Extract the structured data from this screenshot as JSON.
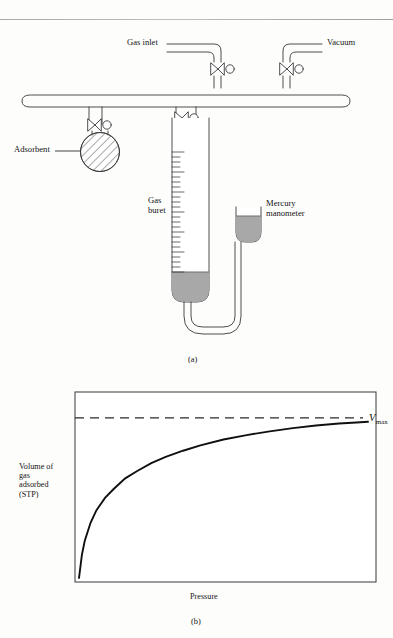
{
  "figure": {
    "panel_a": {
      "caption": "(a)",
      "labels": {
        "gas_inlet": "Gas inlet",
        "vacuum": "Vacuum",
        "adsorbent": "Adsorbent",
        "gas_buret_line1": "Gas",
        "gas_buret_line2": "buret",
        "mercury_line1": "Mercury",
        "mercury_line2": "manometer"
      },
      "colors": {
        "glass_outline": "#3a3a3a",
        "mercury_fill": "#a8a8a8",
        "hatch": "#444444",
        "background": "#fdfdfc"
      },
      "components": [
        "manifold",
        "gas-inlet-tube",
        "vacuum-tube",
        "stopcock-gas-inlet",
        "stopcock-vacuum",
        "stopcock-adsorbent",
        "stopcock-buret",
        "adsorbent-flask",
        "gas-buret",
        "mercury-manometer",
        "u-tube"
      ]
    },
    "panel_b": {
      "caption": "(b)",
      "labels": {
        "ylabel_line1": "Volume of",
        "ylabel_line2": "gas",
        "ylabel_line3": "adsorbed",
        "ylabel_line4": "(STP)",
        "xlabel": "Pressure",
        "vmax_symbol": "V",
        "vmax_subscript": "max"
      },
      "colors": {
        "frame": "#4a4a4a",
        "curve": "#101010",
        "asymptote": "#2a2a2a"
      }
    }
  },
  "chart_data": {
    "type": "line",
    "title": "",
    "xlabel": "Pressure",
    "ylabel": "Volume of gas adsorbed (STP)",
    "grid": false,
    "legend": null,
    "xlim": [
      0,
      1
    ],
    "ylim": [
      0,
      1
    ],
    "axis_ticks": "none",
    "annotations": [
      {
        "name": "vmax-asymptote",
        "text": "Vmax",
        "style": "dashed-horizontal-line",
        "y": 0.9
      }
    ],
    "series": [
      {
        "name": "Langmuir adsorption isotherm",
        "description": "Volume of gas adsorbed rises steeply then saturates at Vmax",
        "x": [
          0.0,
          0.01,
          0.02,
          0.04,
          0.06,
          0.09,
          0.12,
          0.16,
          0.2,
          0.25,
          0.3,
          0.36,
          0.42,
          0.5,
          0.58,
          0.66,
          0.74,
          0.82,
          0.9,
          0.96,
          1.0
        ],
        "y": [
          0.0,
          0.13,
          0.21,
          0.31,
          0.38,
          0.45,
          0.5,
          0.56,
          0.6,
          0.645,
          0.68,
          0.715,
          0.745,
          0.778,
          0.803,
          0.824,
          0.842,
          0.857,
          0.868,
          0.874,
          0.878
        ]
      }
    ]
  }
}
